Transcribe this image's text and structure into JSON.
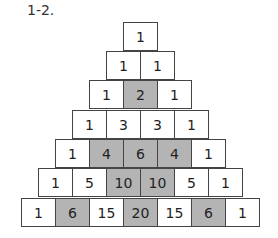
{
  "label": "1-2.",
  "colors": {
    "shaded": "#b4b4b4",
    "plain": "#ffffff",
    "border": "#444444"
  },
  "rows": [
    {
      "cells": [
        {
          "v": "1",
          "s": false
        }
      ]
    },
    {
      "cells": [
        {
          "v": "1",
          "s": false
        },
        {
          "v": "1",
          "s": false
        }
      ]
    },
    {
      "cells": [
        {
          "v": "1",
          "s": false
        },
        {
          "v": "2",
          "s": true
        },
        {
          "v": "1",
          "s": false
        }
      ]
    },
    {
      "cells": [
        {
          "v": "1",
          "s": false
        },
        {
          "v": "3",
          "s": false
        },
        {
          "v": "3",
          "s": false
        },
        {
          "v": "1",
          "s": false
        }
      ]
    },
    {
      "cells": [
        {
          "v": "1",
          "s": false
        },
        {
          "v": "4",
          "s": true
        },
        {
          "v": "6",
          "s": true
        },
        {
          "v": "4",
          "s": true
        },
        {
          "v": "1",
          "s": false
        }
      ]
    },
    {
      "cells": [
        {
          "v": "1",
          "s": false
        },
        {
          "v": "5",
          "s": false
        },
        {
          "v": "10",
          "s": true
        },
        {
          "v": "10",
          "s": true
        },
        {
          "v": "5",
          "s": false
        },
        {
          "v": "1",
          "s": false
        }
      ]
    },
    {
      "cells": [
        {
          "v": "1",
          "s": false
        },
        {
          "v": "6",
          "s": true
        },
        {
          "v": "15",
          "s": false
        },
        {
          "v": "20",
          "s": true
        },
        {
          "v": "15",
          "s": false
        },
        {
          "v": "6",
          "s": true
        },
        {
          "v": "1",
          "s": false
        }
      ]
    }
  ]
}
